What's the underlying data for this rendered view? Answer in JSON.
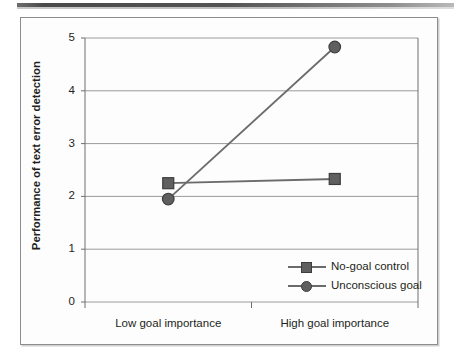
{
  "figure": {
    "top_rule": "decorative-rule"
  },
  "chart_data": {
    "type": "line",
    "title": "",
    "xlabel": "",
    "ylabel": "Performance of text error detection",
    "categories": [
      "Low goal importance",
      "High goal importance"
    ],
    "series": [
      {
        "name": "No-goal control",
        "marker": "square",
        "color": "#5f5f5f",
        "values": [
          2.25,
          2.33
        ]
      },
      {
        "name": "Unconscious goal",
        "marker": "circle",
        "color": "#5f5f5f",
        "values": [
          1.95,
          4.83
        ]
      }
    ],
    "ylim": [
      0,
      5
    ],
    "yticks": [
      0,
      1,
      2,
      3,
      4,
      5
    ],
    "ytick_labels": [
      "0",
      "1",
      "2",
      "3",
      "4",
      "5"
    ],
    "grid": true,
    "grid_axis": "y",
    "legend_position": "inside-lower-right"
  },
  "legend": {
    "items": [
      {
        "label": "No-goal control",
        "marker": "square"
      },
      {
        "label": "Unconscious goal",
        "marker": "circle"
      }
    ]
  },
  "colors": {
    "line": "#6b6b6b",
    "marker_fill": "#5f5f5f",
    "marker_edge": "#3d3d3d",
    "grid": "#9b9b9b",
    "axis": "#6e6e6e",
    "frame": "#8d8d8d",
    "text": "#231f20",
    "plot_background": "#fdfdfd"
  }
}
